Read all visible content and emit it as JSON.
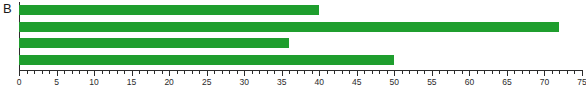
{
  "panel": {
    "label": "B"
  },
  "chart_data": {
    "type": "bar",
    "orientation": "horizontal",
    "title": "",
    "xlabel": "",
    "ylabel": "",
    "categories": [
      "",
      "",
      "",
      ""
    ],
    "values": [
      40,
      72,
      36,
      50
    ],
    "series": [
      {
        "name": "",
        "color": "#1f9e2e",
        "values": [
          40,
          72,
          36,
          50
        ]
      }
    ],
    "xlim": [
      0,
      77.5
    ],
    "ylim": [
      0,
      4
    ],
    "grid": false,
    "legend": false,
    "bar_color": "#1f9e2e",
    "axis_color": "#2b2b2b",
    "background": "#ffffff",
    "xticks": [
      0,
      5,
      10,
      15,
      20,
      25,
      30,
      35,
      40,
      45,
      50,
      55,
      60,
      65,
      70,
      75
    ],
    "xtick_labels": [
      "0",
      "5",
      "10",
      "15",
      "20",
      "25",
      "30",
      "35",
      "40",
      "45",
      "50",
      "55",
      "60",
      "65",
      "70",
      "75"
    ],
    "minor_tick_interval": 1,
    "major_tick_interval": 5
  }
}
